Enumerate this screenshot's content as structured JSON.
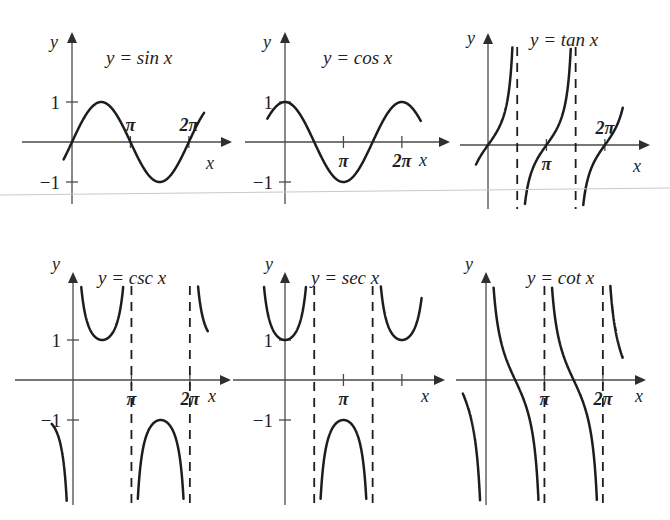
{
  "figure": {
    "background_color": "#ffffff",
    "curve_color": "#1d1d1d",
    "axis_color": "#4a4a4a",
    "width": 670,
    "height": 520,
    "artifact_line": {
      "name": "scan-fold-line",
      "x1": 0,
      "y1": 195,
      "x2": 670,
      "y2": 188,
      "color": "#c9c9c9"
    }
  },
  "chart_data": [
    {
      "id": "sine",
      "type": "line",
      "title": "y = sin x",
      "function": "sin",
      "xlabel": "x",
      "ylabel": "y",
      "xlim": [
        -0.45,
        7.1
      ],
      "ylim": [
        -1.75,
        1.9
      ],
      "ytick_labels": [
        "1",
        "-1"
      ],
      "ytick_values": [
        1,
        -1
      ],
      "xtick_labels": [
        "π",
        "2π"
      ],
      "xtick_values": [
        3.14159,
        6.28319
      ],
      "xtick_label_side": "above",
      "grid": false,
      "legend": "none",
      "asymptotes": [],
      "key_points": [
        {
          "x": 0,
          "y": 0
        },
        {
          "x": 1.5708,
          "y": 1
        },
        {
          "x": 3.14159,
          "y": 0
        },
        {
          "x": 4.71239,
          "y": -1
        },
        {
          "x": 6.28319,
          "y": 0
        }
      ]
    },
    {
      "id": "cosine",
      "type": "line",
      "title": "y = cos x",
      "function": "cos",
      "xlabel": "x",
      "ylabel": "y",
      "xlim": [
        -0.95,
        7.3
      ],
      "ylim": [
        -1.75,
        1.9
      ],
      "ytick_labels": [
        "1",
        "-1"
      ],
      "ytick_values": [
        1,
        -1
      ],
      "xtick_labels": [
        "π",
        "2π"
      ],
      "xtick_values": [
        3.14159,
        6.28319
      ],
      "xtick_label_side": "below",
      "grid": false,
      "legend": "none",
      "asymptotes": [],
      "key_points": [
        {
          "x": 0,
          "y": 1
        },
        {
          "x": 1.5708,
          "y": 0
        },
        {
          "x": 3.14159,
          "y": -1
        },
        {
          "x": 4.71239,
          "y": 0
        },
        {
          "x": 6.28319,
          "y": 1
        }
      ]
    },
    {
      "id": "tangent",
      "type": "line",
      "title": "y = tan x",
      "function": "tan",
      "xlabel": "x",
      "ylabel": "y",
      "xlim": [
        -0.7,
        7.3
      ],
      "ylim": [
        -4.2,
        4.6
      ],
      "ytick_labels": [],
      "ytick_values": [],
      "xtick_labels": [
        "π",
        "2π"
      ],
      "xtick_values": [
        3.14159,
        6.28319
      ],
      "xtick_label_side": "mixed",
      "grid": false,
      "legend": "none",
      "asymptotes": [
        1.5708,
        4.71239
      ],
      "branches": [
        [
          -0.7,
          1.5708
        ],
        [
          1.5708,
          4.71239
        ],
        [
          4.71239,
          7.3
        ]
      ]
    },
    {
      "id": "cosecant",
      "type": "line",
      "title": "y = csc x",
      "function": "csc",
      "xlabel": "x",
      "ylabel": "y",
      "xlim": [
        -1.2,
        7.3
      ],
      "ylim": [
        -4.4,
        4.4
      ],
      "ytick_labels": [
        "1",
        "-1"
      ],
      "ytick_values": [
        1,
        -1
      ],
      "xtick_labels": [
        "π",
        "2π"
      ],
      "xtick_values": [
        3.14159,
        6.28319
      ],
      "xtick_label_side": "below",
      "grid": false,
      "legend": "none",
      "asymptotes": [
        3.14159,
        6.28319
      ],
      "branches": [
        [
          -1.2,
          0
        ],
        [
          0,
          3.14159
        ],
        [
          3.14159,
          6.28319
        ],
        [
          6.28319,
          7.3
        ]
      ]
    },
    {
      "id": "secant",
      "type": "line",
      "title": "y = sec x",
      "function": "sec",
      "xlabel": "x",
      "ylabel": "y",
      "xlim": [
        -1.9,
        7.4
      ],
      "ylim": [
        -4.4,
        4.4
      ],
      "ytick_labels": [
        "1",
        "-1"
      ],
      "ytick_values": [
        1,
        -1
      ],
      "xtick_labels": [
        "π"
      ],
      "xtick_values": [
        3.14159
      ],
      "xtick_label_side": "below",
      "grid": false,
      "legend": "none",
      "asymptotes": [
        1.5708,
        4.71239
      ],
      "branches": [
        [
          -1.9,
          -1.5708
        ],
        [
          -1.5708,
          1.5708
        ],
        [
          1.5708,
          4.71239
        ],
        [
          4.71239,
          7.4
        ]
      ]
    },
    {
      "id": "cotangent",
      "type": "line",
      "title": "y = cot x",
      "function": "cot",
      "xlabel": "x",
      "ylabel": "y",
      "xlim": [
        -1.3,
        7.4
      ],
      "ylim": [
        -4.4,
        4.4
      ],
      "ytick_labels": [],
      "ytick_values": [],
      "xtick_labels": [
        "π",
        "2π"
      ],
      "xtick_values": [
        3.14159,
        6.28319
      ],
      "xtick_label_side": "below",
      "grid": false,
      "legend": "none",
      "asymptotes": [
        3.14159,
        6.28319
      ],
      "branches": [
        [
          -1.3,
          0
        ],
        [
          0,
          3.14159
        ],
        [
          3.14159,
          6.28319
        ],
        [
          6.28319,
          7.4
        ]
      ]
    }
  ],
  "panels": [
    {
      "name": "panel-sine",
      "chart_index": 0,
      "left": 10,
      "top": 14,
      "width": 222,
      "height": 196,
      "origin_x": 62,
      "origin_y": 128,
      "unit_x": 18.6,
      "unit_y": 40,
      "title_x": 96,
      "title_y": 50,
      "ylabel_x": 40,
      "ylabel_y": 34,
      "xlabel_x": 196,
      "xlabel_y": 155,
      "axis_x_start": -50,
      "axis_x_end": 160,
      "axis_y_top": -110,
      "axis_y_bottom": 62
    },
    {
      "name": "panel-cosine",
      "chart_index": 1,
      "left": 233,
      "top": 14,
      "width": 222,
      "height": 196,
      "origin_x": 52,
      "origin_y": 128,
      "unit_x": 18.6,
      "unit_y": 40,
      "title_x": 90,
      "title_y": 50,
      "ylabel_x": 30,
      "ylabel_y": 34,
      "xlabel_x": 186,
      "xlabel_y": 152,
      "axis_x_start": -40,
      "axis_x_end": 165,
      "axis_y_top": -110,
      "axis_y_bottom": 62
    },
    {
      "name": "panel-tangent",
      "chart_index": 2,
      "left": 455,
      "top": 14,
      "width": 215,
      "height": 196,
      "origin_x": 33,
      "origin_y": 131,
      "unit_x": 18.6,
      "unit_y": 26,
      "title_x": 75,
      "title_y": 32,
      "ylabel_x": 12,
      "ylabel_y": 30,
      "xlabel_x": 178,
      "xlabel_y": 158,
      "axis_x_start": -28,
      "axis_x_end": 162,
      "axis_y_top": -112,
      "axis_y_bottom": 64
    },
    {
      "name": "panel-cosecant",
      "chart_index": 3,
      "left": 10,
      "top": 262,
      "width": 222,
      "height": 252,
      "origin_x": 63,
      "origin_y": 118,
      "unit_x": 18.6,
      "unit_y": 40,
      "title_x": 88,
      "title_y": 22,
      "ylabel_x": 42,
      "ylabel_y": 8,
      "xlabel_x": 198,
      "xlabel_y": 140,
      "axis_x_start": -58,
      "axis_x_end": 158,
      "axis_y_top": -108,
      "axis_y_bottom": 125
    },
    {
      "name": "panel-secant",
      "chart_index": 4,
      "left": 233,
      "top": 262,
      "width": 222,
      "height": 252,
      "origin_x": 52,
      "origin_y": 118,
      "unit_x": 18.6,
      "unit_y": 40,
      "title_x": 78,
      "title_y": 22,
      "ylabel_x": 32,
      "ylabel_y": 8,
      "xlabel_x": 188,
      "xlabel_y": 140,
      "axis_x_start": -52,
      "axis_x_end": 160,
      "axis_y_top": -108,
      "axis_y_bottom": 125
    },
    {
      "name": "panel-cotangent",
      "chart_index": 5,
      "left": 455,
      "top": 262,
      "width": 215,
      "height": 252,
      "origin_x": 31,
      "origin_y": 118,
      "unit_x": 18.6,
      "unit_y": 40,
      "title_x": 72,
      "title_y": 22,
      "ylabel_x": 10,
      "ylabel_y": 8,
      "xlabel_x": 180,
      "xlabel_y": 140,
      "axis_x_start": -30,
      "axis_x_end": 160,
      "axis_y_top": -108,
      "axis_y_bottom": 125
    }
  ]
}
